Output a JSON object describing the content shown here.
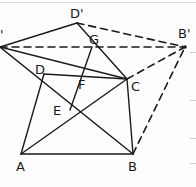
{
  "diagram": {
    "type": "geometry-construction",
    "points": {
      "A_prime": {
        "label": "A'",
        "x": 0,
        "y": 47
      },
      "D_prime": {
        "label": "D'",
        "x": 77,
        "y": 23
      },
      "G": {
        "label": "G",
        "x": 92,
        "y": 47
      },
      "B_prime": {
        "label": "B'",
        "x": 185,
        "y": 47
      },
      "D": {
        "label": "D",
        "x": 44,
        "y": 74
      },
      "F": {
        "label": "F",
        "x": 80,
        "y": 75
      },
      "C": {
        "label": "C",
        "x": 127,
        "y": 79
      },
      "E": {
        "label": "E",
        "x": 70,
        "y": 110
      },
      "A": {
        "label": "A",
        "x": 21,
        "y": 154
      },
      "B": {
        "label": "B",
        "x": 133,
        "y": 154
      }
    },
    "labels": {
      "A_prime": "'",
      "D_prime": "D'",
      "G": "G",
      "B_prime": "B'",
      "D": "D",
      "F": "F",
      "C": "C",
      "E": "E",
      "A": "A",
      "B": "B"
    },
    "solid_segments": [
      [
        "A_prime",
        "D_prime"
      ],
      [
        "D_prime",
        "C"
      ],
      [
        "A_prime",
        "C"
      ],
      [
        "A_prime",
        "B"
      ],
      [
        "A",
        "D"
      ],
      [
        "D",
        "C"
      ],
      [
        "C",
        "B"
      ],
      [
        "A",
        "B"
      ],
      [
        "A",
        "C"
      ],
      [
        "E",
        "G"
      ]
    ],
    "dashed_segments": [
      [
        "D_prime",
        "B_prime"
      ],
      [
        "A_prime",
        "B_prime"
      ],
      [
        "C",
        "B_prime"
      ],
      [
        "B",
        "B_prime"
      ]
    ],
    "colors": {
      "stroke": "#1a1a1a",
      "background": "#fdfdfd"
    }
  }
}
